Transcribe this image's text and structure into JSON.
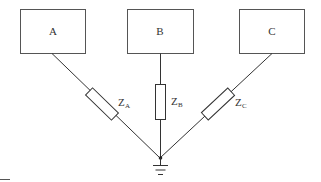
{
  "diagram": {
    "type": "star-connected impedance network with grounded neutral",
    "nodes": [
      {
        "id": "A",
        "label": "A"
      },
      {
        "id": "B",
        "label": "B"
      },
      {
        "id": "C",
        "label": "C"
      }
    ],
    "impedances": [
      {
        "id": "ZA",
        "symbol": "Z",
        "subscript": "A",
        "connects": [
          "A",
          "neutral"
        ]
      },
      {
        "id": "ZB",
        "symbol": "Z",
        "subscript": "B",
        "connects": [
          "B",
          "neutral"
        ]
      },
      {
        "id": "ZC",
        "symbol": "Z",
        "subscript": "C",
        "connects": [
          "C",
          "neutral"
        ]
      }
    ],
    "neutral": {
      "grounded": true,
      "symbol": "ground"
    },
    "colors": {
      "line": "#333333",
      "box_border": "#555555",
      "background": "#ffffff"
    }
  }
}
